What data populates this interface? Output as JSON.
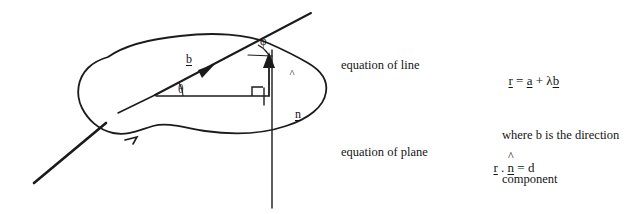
{
  "document": {
    "title": "Line and plane vector equations diagram",
    "background_color": "#ffffff",
    "ink_color": "#151515"
  },
  "diagram": {
    "name": "plane-with-intersecting-line",
    "labels": {
      "direction_vector": "b",
      "unit_normal": "n",
      "unit_normal_hat": "^",
      "angle_in_plane": "θ",
      "angle_to_normal": "φ"
    },
    "elements": [
      "plane-blob-outline",
      "intersecting-line",
      "direction-vector-arrow",
      "normal-vector-arrow",
      "vertical-axis-line",
      "right-angle-marker",
      "theta-angle-arc",
      "phi-angle-arc",
      "baseline-segment"
    ]
  },
  "annotations": {
    "line_row": {
      "label": "equation of line",
      "equation": {
        "r": "r",
        "eq": " = ",
        "a": "a",
        "plus": " + ",
        "lambda": "λ",
        "b": "b"
      }
    },
    "note": {
      "line1": "where b is the direction",
      "line2": "component"
    },
    "plane_row": {
      "label": "equation of plane",
      "equation": {
        "r": "r",
        "dot": " . ",
        "n": "n",
        "hat": "^",
        "eq": " = ",
        "d": "d"
      }
    }
  }
}
